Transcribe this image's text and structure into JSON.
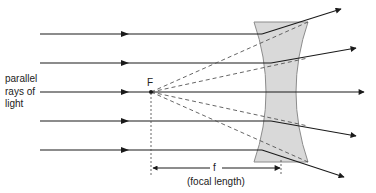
{
  "diagram": {
    "type": "optics-ray-diagram",
    "labels": {
      "incoming_line1": "parallel",
      "incoming_line2": "rays of",
      "incoming_line3": "light",
      "focal_point": "F",
      "focal_symbol": "f",
      "focal_caption": "(focal length)"
    },
    "colors": {
      "ray": "#1a1a1a",
      "lens_fill": "#d9d9d9",
      "lens_stroke": "#8c8c8c",
      "construction": "#555555"
    },
    "rays": [
      {
        "y": 34,
        "exit_x": 341,
        "exit_y": 9
      },
      {
        "y": 63,
        "exit_x": 356,
        "exit_y": 48
      },
      {
        "y": 92,
        "exit_x": 364,
        "exit_y": 92
      },
      {
        "y": 121,
        "exit_x": 356,
        "exit_y": 136
      },
      {
        "y": 150,
        "exit_x": 344,
        "exit_y": 177
      }
    ],
    "focal_point": {
      "x": 151,
      "y": 92
    },
    "lens": {
      "top_y": 22,
      "bottom_y": 162,
      "left_x": 254,
      "right_x": 308,
      "waist_left": 272,
      "waist_right": 290
    }
  }
}
